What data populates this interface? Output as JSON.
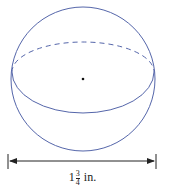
{
  "figure": {
    "shape": "sphere",
    "colors": {
      "outline": "#5566aa",
      "center_dot": "#111111",
      "dimension": "#222222"
    },
    "dimension_label": {
      "whole": "1",
      "numerator": "3",
      "denominator": "4",
      "unit": "in."
    }
  }
}
